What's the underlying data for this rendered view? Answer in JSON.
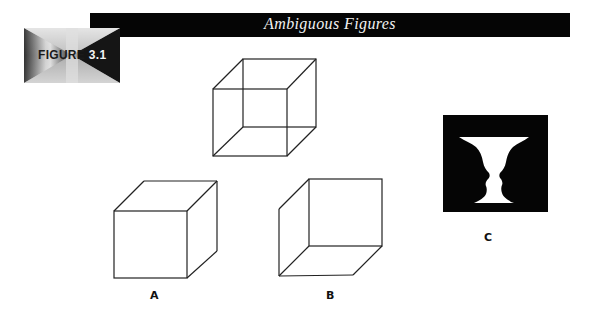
{
  "header": {
    "title": "Ambiguous Figures",
    "figure_badge_word": "FIGURE",
    "figure_badge_number": "3.1"
  },
  "figures": {
    "necker_cube": {
      "label": ""
    },
    "cube_a": {
      "label": "A"
    },
    "cube_b": {
      "label": "B"
    },
    "rubin_vase": {
      "label": "C"
    }
  },
  "colors": {
    "banner": "#050505",
    "banner_text": "#f2f2f2",
    "line": "#222222",
    "vase_background": "#050505",
    "vase": "#ffffff"
  }
}
